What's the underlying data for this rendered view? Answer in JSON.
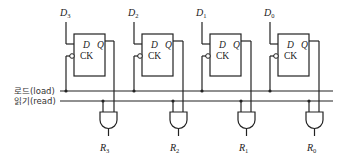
{
  "diagram": {
    "inputs": [
      {
        "name": "D",
        "sub": "3"
      },
      {
        "name": "D",
        "sub": "2"
      },
      {
        "name": "D",
        "sub": "1"
      },
      {
        "name": "D",
        "sub": "0"
      }
    ],
    "flipflop": {
      "d_label": "D",
      "q_label": "Q",
      "clk_label": "CK"
    },
    "lines": {
      "load": "로드(load)",
      "read": "읽기(read)"
    },
    "outputs": [
      {
        "name": "R",
        "sub": "3"
      },
      {
        "name": "R",
        "sub": "2"
      },
      {
        "name": "R",
        "sub": "1"
      },
      {
        "name": "R",
        "sub": "0"
      }
    ]
  }
}
